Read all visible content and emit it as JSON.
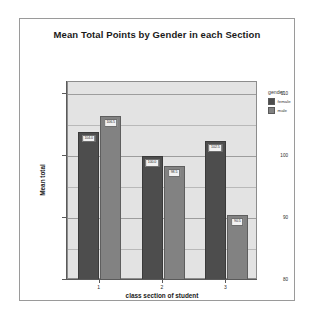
{
  "chart_data": {
    "type": "bar",
    "title": "Mean Total Points by Gender in each Section",
    "xlabel": "class section of student",
    "ylabel": "Mean total",
    "categories": [
      "1",
      "2",
      "3"
    ],
    "series": [
      {
        "name": "female",
        "color": "#4d4d4d",
        "values": [
          104.0,
          100.0,
          102.5
        ],
        "labels": [
          "104.0",
          "100.0",
          "102.5"
        ]
      },
      {
        "name": "male",
        "color": "#828282",
        "values": [
          106.5,
          98.5,
          90.5
        ],
        "labels": [
          "106.5",
          "98.5",
          "90.5"
        ]
      }
    ],
    "ylim": [
      80,
      112
    ],
    "yticks": [
      110,
      100,
      90,
      80
    ],
    "ytick_labels": [
      "110",
      "100",
      "90",
      "80"
    ],
    "minor_gridlines": [
      105,
      95,
      85
    ],
    "grid": true,
    "legend": {
      "title": "gender",
      "position": "right"
    }
  }
}
